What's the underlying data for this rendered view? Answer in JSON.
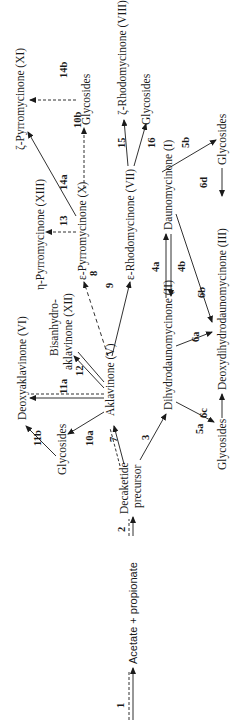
{
  "diagram": {
    "orientation": "rotated-90-ccw",
    "nodes": {
      "acetate": "Acetate + propionate",
      "decaketide_1": "Decaketide",
      "decaketide_2": "precursor",
      "aklavinone": "Aklavinone (V)",
      "glycosides_akla": "Glycosides",
      "deoxyaklavinone": "Deoxyaklavinone (VI)",
      "bisanhydro_1": "Bisanhydro-",
      "bisanhydro_2": "aklavinone (XII)",
      "eta_pyrromycinone": "η-Pyrromycinone (XIII)",
      "eps_pyrromycinone": "ε-Pyrromycinone (X)",
      "zeta_pyrromycinone": "ζ-Pyrromycinone (XI)",
      "glycosides_pyrro": "Glycosides",
      "eps_rhodomycinone": "ε-Rhodomycinone (VII)",
      "zeta_rhodomycinone": "ζ-Rhodomycinone (VIII)",
      "glycosides_rhodo": "Glycosides",
      "dihydrodaunomycinone": "Dihydrodaunomycinone (II)",
      "daunomycinone": "Daunomycinone (I)",
      "deoxydihydrodaunomycinone": "Deoxydihydrodaunomycinone (III)",
      "glycosides_dihydro": "Glycosides",
      "glycosides_dauno": "Glycosides"
    },
    "steps": {
      "s1": "1",
      "s2": "2",
      "s3": "3",
      "s4a": "4a",
      "s4b": "4b",
      "s5a": "5a",
      "s5b": "5b",
      "s6a": "6a",
      "s6b": "6b",
      "s6c": "6c",
      "s6d": "6d",
      "s7": "7",
      "s8": "8",
      "s9": "9",
      "s10a": "10a",
      "s10b": "10b",
      "s11a": "11a",
      "s11b": "11b",
      "s12": "12",
      "s13": "13",
      "s14a": "14a",
      "s14b": "14b",
      "s15": "15",
      "s16": "16"
    }
  }
}
